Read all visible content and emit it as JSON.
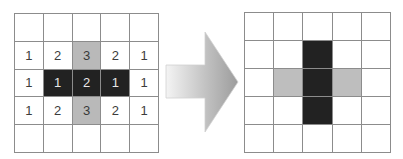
{
  "diagram": {
    "colors": {
      "dark": "#222222",
      "gray": "#b9b9b9",
      "white": "#ffffff",
      "grid_line": "#8c8c8c",
      "arrow_light": "#f2f2f2",
      "arrow_dark": "#9a9a9a"
    },
    "left_grid": {
      "rows": [
        [
          {
            "v": "",
            "s": "white"
          },
          {
            "v": "",
            "s": "white"
          },
          {
            "v": "",
            "s": "white"
          },
          {
            "v": "",
            "s": "white"
          },
          {
            "v": "",
            "s": "white"
          }
        ],
        [
          {
            "v": "1",
            "s": "white"
          },
          {
            "v": "2",
            "s": "white"
          },
          {
            "v": "3",
            "s": "gray"
          },
          {
            "v": "2",
            "s": "white"
          },
          {
            "v": "1",
            "s": "white"
          }
        ],
        [
          {
            "v": "1",
            "s": "white"
          },
          {
            "v": "1",
            "s": "dark"
          },
          {
            "v": "2",
            "s": "dark"
          },
          {
            "v": "1",
            "s": "dark"
          },
          {
            "v": "1",
            "s": "white"
          }
        ],
        [
          {
            "v": "1",
            "s": "white"
          },
          {
            "v": "2",
            "s": "white"
          },
          {
            "v": "3",
            "s": "gray"
          },
          {
            "v": "2",
            "s": "white"
          },
          {
            "v": "1",
            "s": "white"
          }
        ],
        [
          {
            "v": "",
            "s": "white"
          },
          {
            "v": "",
            "s": "white"
          },
          {
            "v": "",
            "s": "white"
          },
          {
            "v": "",
            "s": "white"
          },
          {
            "v": "",
            "s": "white"
          }
        ]
      ]
    },
    "arrow": {
      "direction": "right",
      "icon": "arrow-right-icon"
    },
    "right_grid": {
      "rows": [
        [
          {
            "v": "",
            "s": "white"
          },
          {
            "v": "",
            "s": "white"
          },
          {
            "v": "",
            "s": "white"
          },
          {
            "v": "",
            "s": "white"
          },
          {
            "v": "",
            "s": "white"
          }
        ],
        [
          {
            "v": "",
            "s": "white"
          },
          {
            "v": "",
            "s": "white"
          },
          {
            "v": "",
            "s": "dark"
          },
          {
            "v": "",
            "s": "white"
          },
          {
            "v": "",
            "s": "white"
          }
        ],
        [
          {
            "v": "",
            "s": "white"
          },
          {
            "v": "",
            "s": "gray"
          },
          {
            "v": "",
            "s": "dark"
          },
          {
            "v": "",
            "s": "gray"
          },
          {
            "v": "",
            "s": "white"
          }
        ],
        [
          {
            "v": "",
            "s": "white"
          },
          {
            "v": "",
            "s": "white"
          },
          {
            "v": "",
            "s": "dark"
          },
          {
            "v": "",
            "s": "white"
          },
          {
            "v": "",
            "s": "white"
          }
        ],
        [
          {
            "v": "",
            "s": "white"
          },
          {
            "v": "",
            "s": "white"
          },
          {
            "v": "",
            "s": "white"
          },
          {
            "v": "",
            "s": "white"
          },
          {
            "v": "",
            "s": "white"
          }
        ]
      ]
    }
  }
}
